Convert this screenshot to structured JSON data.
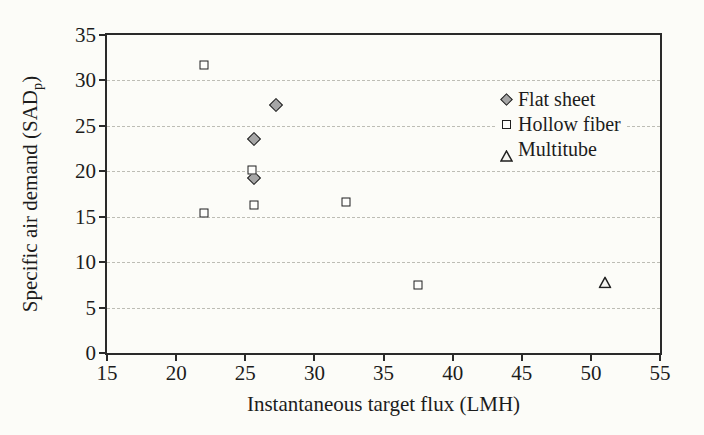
{
  "figure": {
    "background_color": "#fcfcf8",
    "axis_color": "#2a2a2a",
    "grid_color": "#bdbdb5",
    "text_color": "#1c1c1c"
  },
  "chart_data": {
    "type": "scatter",
    "title": "",
    "xlabel": "Instantaneous target flux (LMH)",
    "ylabel_parts": {
      "main": "Specific air demand (SAD",
      "sub": "p",
      "close": ")"
    },
    "xlim": [
      15,
      55
    ],
    "ylim": [
      0,
      35
    ],
    "x_ticks": [
      "15",
      "20",
      "25",
      "30",
      "35",
      "40",
      "45",
      "50",
      "55"
    ],
    "y_ticks": [
      "0",
      "5",
      "10",
      "15",
      "20",
      "25",
      "30",
      "35"
    ],
    "grid": "horizontal dashed lines at each y tick",
    "legend_position": "upper-right inside plot",
    "series": [
      {
        "name": "Flat sheet",
        "marker": "diamond",
        "fill": "#a6a6a6",
        "edge": "#1f1f1f",
        "points": [
          [
            25.6,
            23.5
          ],
          [
            25.6,
            19.3
          ],
          [
            27.2,
            27.3
          ]
        ]
      },
      {
        "name": "Hollow fiber",
        "marker": "square",
        "fill": "#fdfdfb",
        "edge": "#1f1f1f",
        "points": [
          [
            22.0,
            31.7
          ],
          [
            22.0,
            15.4
          ],
          [
            25.5,
            20.1
          ],
          [
            25.6,
            16.3
          ],
          [
            32.3,
            16.6
          ],
          [
            37.5,
            7.5
          ]
        ]
      },
      {
        "name": "Multitube",
        "marker": "triangle",
        "fill": "#f5f5f1",
        "edge": "#1f1f1f",
        "points": [
          [
            51.0,
            7.9
          ]
        ]
      }
    ]
  }
}
